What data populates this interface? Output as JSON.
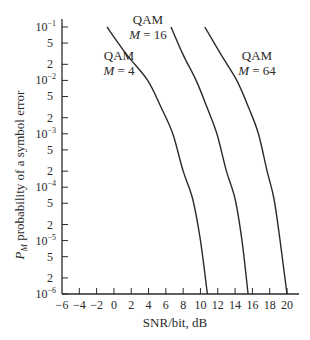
{
  "chart_data": {
    "type": "line",
    "title": "",
    "xlabel": "SNR/bit, dB",
    "ylabel_prefix": "P",
    "ylabel_sub": "M",
    "ylabel_rest": " probability of a symbol error",
    "xlim": [
      -6,
      20
    ],
    "ylim": [
      1e-06,
      0.1
    ],
    "yscale": "log",
    "grid": false,
    "x_ticks": [
      -6,
      -4,
      -2,
      0,
      2,
      4,
      6,
      8,
      10,
      12,
      14,
      16,
      18,
      20
    ],
    "x_tick_labels": [
      "−6",
      "−4",
      "−2",
      "0",
      "2",
      "4",
      "6",
      "8",
      "10",
      "12",
      "14",
      "16",
      "18",
      "20"
    ],
    "y_major_ticks": [
      {
        "exp": -1,
        "label_base": "10",
        "label_exp": "−1"
      },
      {
        "exp": -2,
        "label_base": "10",
        "label_exp": "−2"
      },
      {
        "exp": -3,
        "label_base": "10",
        "label_exp": "−3"
      },
      {
        "exp": -4,
        "label_base": "10",
        "label_exp": "−4"
      },
      {
        "exp": -5,
        "label_base": "10",
        "label_exp": "−5"
      },
      {
        "exp": -6,
        "label_base": "10",
        "label_exp": "−6"
      }
    ],
    "y_minor_ticks": [
      {
        "value": 0.05,
        "label": "5"
      },
      {
        "value": 0.02,
        "label": "2"
      },
      {
        "value": 0.005,
        "label": "5"
      },
      {
        "value": 0.002,
        "label": "2"
      },
      {
        "value": 0.0005,
        "label": "5"
      },
      {
        "value": 0.0002,
        "label": "2"
      },
      {
        "value": 5e-05,
        "label": "5"
      },
      {
        "value": 2e-05,
        "label": "2"
      },
      {
        "value": 5e-06,
        "label": "5"
      },
      {
        "value": 2e-06,
        "label": "2"
      }
    ],
    "series": [
      {
        "name": "QAM M = 4",
        "label_line1": "QAM",
        "label_line2_var": "M",
        "label_line2_val": " = 4",
        "label_pos": {
          "x": 119,
          "y": 60
        },
        "x": [
          -0.8,
          1.5,
          3.9,
          5.5,
          6.8,
          8.0,
          9.1,
          10.0,
          10.8
        ],
        "y": [
          0.1,
          0.03,
          0.01,
          0.003,
          0.001,
          0.0002,
          6e-05,
          1e-05,
          1e-06
        ]
      },
      {
        "name": "QAM M = 16",
        "label_line1": "QAM",
        "label_line2_var": "M",
        "label_line2_val": " = 16",
        "label_pos": {
          "x": 148,
          "y": 24
        },
        "x": [
          6.6,
          8.0,
          9.5,
          10.8,
          11.9,
          13.0,
          14.0,
          14.8,
          15.5
        ],
        "y": [
          0.1,
          0.03,
          0.01,
          0.003,
          0.001,
          0.0002,
          6e-05,
          1e-05,
          1e-06
        ]
      },
      {
        "name": "QAM M = 64",
        "label_line1": "QAM",
        "label_line2_var": "M",
        "label_line2_val": " = 64",
        "label_pos": {
          "x": 257,
          "y": 60
        },
        "x": [
          10.5,
          12.4,
          14.2,
          15.6,
          16.7,
          17.7,
          18.5,
          19.2,
          20.0
        ],
        "y": [
          0.1,
          0.03,
          0.01,
          0.003,
          0.001,
          0.0002,
          6e-05,
          1e-05,
          1e-06
        ]
      }
    ],
    "line_color": "#2a2a2a",
    "legend": "inline labels beside curves"
  }
}
